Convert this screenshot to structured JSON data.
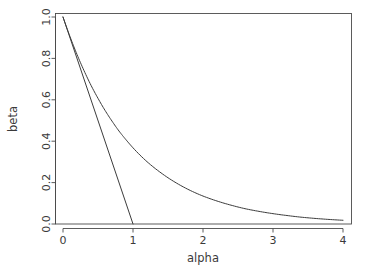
{
  "chart_data": {
    "type": "line",
    "title": "",
    "subtitle": "",
    "xlabel": "alpha",
    "ylabel": "beta",
    "xlim": [
      -0.08,
      4.12
    ],
    "ylim": [
      -0.03,
      1.02
    ],
    "grid": false,
    "legend": "none",
    "xticks": [
      0,
      1,
      2,
      3,
      4
    ],
    "xticklabels": [
      "0",
      "1",
      "2",
      "3",
      "4"
    ],
    "yticks": [
      0.0,
      0.2,
      0.4,
      0.6,
      0.8,
      1.0
    ],
    "yticklabels": [
      "0.0",
      "0.2",
      "0.4",
      "0.6",
      "0.8",
      "1.0"
    ],
    "series": [
      {
        "name": "exponential-decay",
        "color": "#3c3c3c",
        "x": [
          0.0,
          0.1,
          0.2,
          0.3,
          0.4,
          0.5,
          0.6,
          0.7,
          0.8,
          0.9,
          1.0,
          1.2,
          1.4,
          1.6,
          1.8,
          2.0,
          2.2,
          2.4,
          2.6,
          2.8,
          3.0,
          3.2,
          3.4,
          3.6,
          3.8,
          4.0
        ],
        "values": [
          1.0,
          0.905,
          0.819,
          0.741,
          0.67,
          0.607,
          0.549,
          0.497,
          0.449,
          0.407,
          0.368,
          0.301,
          0.247,
          0.202,
          0.165,
          0.135,
          0.111,
          0.091,
          0.074,
          0.061,
          0.05,
          0.041,
          0.033,
          0.027,
          0.022,
          0.018
        ]
      },
      {
        "name": "tangent-line",
        "color": "#3c3c3c",
        "x": [
          0.0,
          1.0
        ],
        "values": [
          1.0,
          0.0
        ]
      }
    ]
  },
  "axes": {
    "x_title": "alpha",
    "y_title": "beta",
    "x_tick_labels": [
      "0",
      "1",
      "2",
      "3",
      "4"
    ],
    "y_tick_labels": [
      "0.0",
      "0.2",
      "0.4",
      "0.6",
      "0.8",
      "1.0"
    ]
  },
  "style": {
    "line_color": "#3c3c3c",
    "axis_color": "#4a4a4a",
    "text_color": "#3a3a3a",
    "background": "#ffffff"
  }
}
